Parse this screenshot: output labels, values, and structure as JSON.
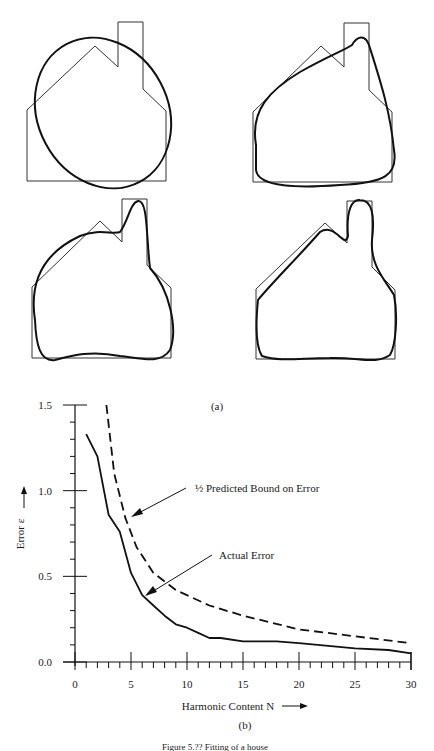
{
  "figure": {
    "panel_a_label": "(a)",
    "panel_b_label": "(b)",
    "caption": "Figure 5.?? Fitting of a house"
  },
  "panel_a": {
    "description": "House outline approximated by Fourier descriptors with increasing harmonic content",
    "houses": [
      {
        "position": "top-left",
        "approximation": "ellipse (low harmonics)"
      },
      {
        "position": "top-right",
        "approximation": "few harmonics"
      },
      {
        "position": "bottom-left",
        "approximation": "more harmonics"
      },
      {
        "position": "bottom-right",
        "approximation": "many harmonics"
      }
    ]
  },
  "chart_data": {
    "type": "line",
    "title": "",
    "xlabel": "Harmonic Content N",
    "ylabel": "Error ε",
    "xlim": [
      0,
      30
    ],
    "ylim": [
      0,
      1.5
    ],
    "x_ticks": [
      "0",
      "5",
      "10",
      "15",
      "20",
      "25",
      "30"
    ],
    "y_ticks": [
      "0.0",
      "0.5",
      "1.0",
      "1.5"
    ],
    "grid": false,
    "legend": "annotations with arrows",
    "series": [
      {
        "name": "Actual Error",
        "style": "solid",
        "x": [
          1,
          2,
          3,
          4,
          5,
          6,
          7,
          8,
          9,
          10,
          11,
          12,
          13,
          15,
          18,
          20,
          25,
          28,
          30
        ],
        "y": [
          1.33,
          1.2,
          0.86,
          0.76,
          0.52,
          0.39,
          0.33,
          0.27,
          0.22,
          0.2,
          0.17,
          0.14,
          0.14,
          0.12,
          0.12,
          0.11,
          0.08,
          0.07,
          0.05
        ]
      },
      {
        "name": "½ Predicted Bound on Error",
        "style": "dashed",
        "x": [
          2.8,
          3.5,
          4.5,
          5.5,
          7,
          9,
          12,
          15,
          20,
          25,
          30
        ],
        "y": [
          1.5,
          1.1,
          0.84,
          0.67,
          0.52,
          0.42,
          0.33,
          0.27,
          0.19,
          0.15,
          0.11
        ]
      }
    ],
    "annotations": [
      {
        "text": "½ Predicted Bound on Error",
        "points_to_series": 1
      },
      {
        "text": "Actual Error",
        "points_to_series": 0
      }
    ]
  }
}
